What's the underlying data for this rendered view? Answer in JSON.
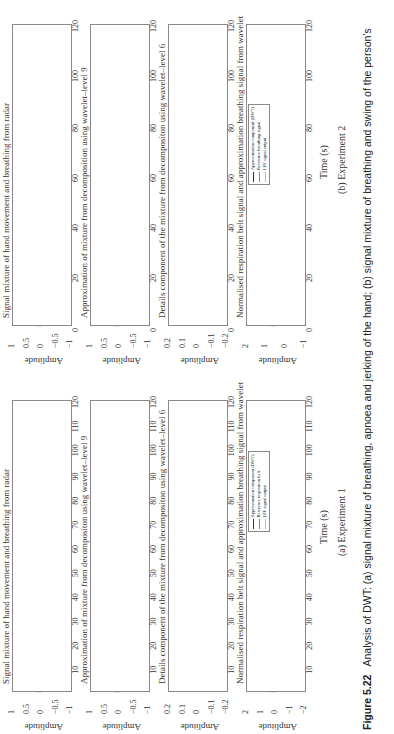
{
  "figure": {
    "number": "Figure 5.22",
    "caption": "Analysis of DWT: (a) signal mixture of breathing, apnoea and jerking of the hand; (b) signal mixture of breathing and swing of the person's",
    "caption_line2": "right hand, and the result of denoising"
  },
  "experiment_a": {
    "sublabel": "(a) Experiment 1",
    "xlabel": "Time (s)",
    "xticks": [
      "10",
      "20",
      "30",
      "40",
      "50",
      "60",
      "70",
      "80",
      "90",
      "100",
      "110",
      "120"
    ],
    "panels": [
      {
        "title": "Signal mixture of hand movement and breathing from radar",
        "ylabel": "Amplitude",
        "yticks": [
          "1",
          "0.5",
          "0",
          "−0.5",
          "−1"
        ]
      },
      {
        "title": "Approximation of mixture from decompositon using wavelet–level 9",
        "ylabel": "Amplitude",
        "yticks": [
          "1",
          "0.5",
          "0",
          "−0.5",
          "−1"
        ]
      },
      {
        "title": "Details component of the mixture from decompositon using wavelet–level 6",
        "ylabel": "Amplitude",
        "yticks": [
          "0.2",
          "0.1",
          "0",
          "−0.1",
          "−0.2"
        ]
      },
      {
        "title": "Normalised respiration belt signal and approximation breathing signal from wavelet",
        "ylabel": "Amplitude",
        "yticks": [
          "2",
          "1",
          "0",
          "−1",
          "−2"
        ],
        "legend": [
          "Approximation component (DWT)",
          "Reference respiration belt",
          "LPF signal output"
        ]
      }
    ]
  },
  "experiment_b": {
    "sublabel": "(b) Experiment 2",
    "xlabel": "Time (s)",
    "xticks": [
      "0",
      "20",
      "40",
      "60",
      "80",
      "100",
      "120"
    ],
    "panels": [
      {
        "title": "Signal mixture of hand movement and breathing from radar",
        "ylabel": "Amplitude",
        "yticks": [
          "1",
          "0.5",
          "0",
          "−0.5",
          "−1"
        ]
      },
      {
        "title": "Approximation of mixture from decomposition using wavelet–level 9",
        "ylabel": "Amplitude",
        "yticks": [
          "1",
          "0.5",
          "0",
          "−0.5",
          "−1"
        ]
      },
      {
        "title": "Details component of the mixture from decompositon using wavelet–level 6",
        "ylabel": "Amplitude",
        "yticks": [
          "0.2",
          "0.1",
          "0",
          "−0.1",
          "−0.2"
        ]
      },
      {
        "title": "Normalised respiration belt signal and approximation breathing signal from wavelet",
        "ylabel": "Amplitude",
        "yticks": [
          "2",
          "1",
          "0",
          "−1"
        ],
        "legend": [
          "Approximation component (DWT)",
          "Reference breathing signal",
          "LPF signal output"
        ]
      }
    ]
  },
  "chart_data": [
    {
      "type": "line",
      "title": "Signal mixture of hand movement and breathing from radar",
      "subfigure": "(a) Experiment 1",
      "xlabel": "Time (s)",
      "ylabel": "Amplitude",
      "xlim": [
        0,
        120
      ],
      "ylim": [
        -1,
        1
      ],
      "notes": "Breathing oscillation ~0.3 Hz with noisy hand-jerk bursts 15–60 s; apnoea flat segment ~68–82 s",
      "series": [
        {
          "name": "radar mixture",
          "x": [
            0,
            10,
            20,
            30,
            40,
            50,
            60,
            66,
            70,
            80,
            83,
            90,
            100,
            110,
            120
          ],
          "values": [
            0.3,
            0.5,
            0.6,
            -0.7,
            0.7,
            0.6,
            0.3,
            -0.6,
            -0.2,
            -0.1,
            0.5,
            0.5,
            0.5,
            0.5,
            0.5
          ]
        }
      ]
    },
    {
      "type": "line",
      "title": "Approximation of mixture from decompositon using wavelet–level 9",
      "subfigure": "(a) Experiment 1",
      "xlabel": "Time (s)",
      "ylabel": "Amplitude",
      "xlim": [
        0,
        120
      ],
      "ylim": [
        -1,
        1
      ],
      "series": [
        {
          "name": "approximation",
          "x": [
            0,
            10,
            20,
            30,
            40,
            50,
            60,
            66,
            70,
            80,
            83,
            90,
            100,
            110,
            120
          ],
          "values": [
            0.4,
            0.5,
            0.4,
            -0.6,
            0.5,
            0.5,
            0.4,
            -0.6,
            -0.2,
            -0.1,
            0.5,
            0.5,
            0.5,
            0.5,
            0.5
          ]
        }
      ]
    },
    {
      "type": "line",
      "title": "Details component of the mixture from decompositon using wavelet–level 6",
      "subfigure": "(a) Experiment 1",
      "xlabel": "Time (s)",
      "ylabel": "Amplitude",
      "xlim": [
        0,
        120
      ],
      "ylim": [
        -0.2,
        0.2
      ],
      "notes": "Bursts between ~16 s and ~61 s, peak spike ~0.15 near 47 s; near zero elsewhere",
      "series": [
        {
          "name": "details",
          "x": [
            0,
            16,
            20,
            25,
            35,
            45,
            47,
            55,
            61,
            120
          ],
          "values": [
            0,
            0.03,
            0.05,
            0.04,
            0.04,
            0.06,
            0.15,
            0.07,
            0.03,
            0
          ]
        }
      ]
    },
    {
      "type": "line",
      "title": "Normalised respiration belt signal and approximation breathing signal from wavelet",
      "subfigure": "(a) Experiment 1",
      "xlabel": "Time (s)",
      "ylabel": "Amplitude",
      "xlim": [
        0,
        120
      ],
      "ylim": [
        -2,
        2
      ],
      "legend": [
        "Approximation component (DWT)",
        "Reference respiration belt",
        "LPF signal output"
      ],
      "series": [
        {
          "name": "Approximation component (DWT)",
          "x": [
            0,
            20,
            40,
            60,
            66,
            70,
            80,
            90,
            100,
            110,
            120
          ],
          "values": [
            1,
            1,
            1,
            1,
            -1.5,
            -0.8,
            -0.6,
            1,
            1,
            1,
            1
          ]
        },
        {
          "name": "Reference respiration belt",
          "x": [
            0,
            20,
            40,
            60,
            66,
            70,
            80,
            90,
            100,
            110,
            120
          ],
          "values": [
            1,
            1,
            1,
            1,
            -1.4,
            -1.0,
            -0.7,
            1,
            1,
            1,
            1
          ]
        },
        {
          "name": "LPF signal output",
          "x": [
            0,
            20,
            40,
            60,
            66,
            70,
            80,
            90,
            100,
            110,
            120
          ],
          "values": [
            1,
            1,
            1,
            1,
            -1.4,
            -0.9,
            -0.7,
            1,
            1,
            1,
            1
          ]
        }
      ]
    },
    {
      "type": "line",
      "title": "Signal mixture of hand movement and breathing from radar",
      "subfigure": "(b) Experiment 2",
      "xlabel": "Time (s)",
      "ylabel": "Amplitude",
      "xlim": [
        0,
        120
      ],
      "ylim": [
        -1,
        1
      ],
      "notes": "Clean breathing 0–35 s, noisy bursts ~35–57 s and ~65–105 s",
      "series": [
        {
          "name": "radar mixture",
          "x": [
            0,
            20,
            35,
            45,
            57,
            65,
            80,
            100,
            105,
            120
          ],
          "values": [
            0.5,
            0.5,
            0.6,
            0.8,
            0.6,
            0.4,
            0.3,
            0.4,
            0.5,
            0.5
          ]
        }
      ]
    },
    {
      "type": "line",
      "title": "Approximation of mixture from decomposition using wavelet–level 9",
      "subfigure": "(b) Experiment 2",
      "xlabel": "Time (s)",
      "ylabel": "Amplitude",
      "xlim": [
        0,
        120
      ],
      "ylim": [
        -1,
        1
      ],
      "series": [
        {
          "name": "approximation",
          "x": [
            0,
            20,
            40,
            60,
            80,
            100,
            120
          ],
          "values": [
            0.5,
            0.5,
            0.5,
            0.5,
            0.4,
            0.5,
            0.6
          ]
        }
      ]
    },
    {
      "type": "line",
      "title": "Details component of the mixture from decompositon using wavelet–level 6",
      "subfigure": "(b) Experiment 2",
      "xlabel": "Time (s)",
      "ylabel": "Amplitude",
      "xlim": [
        0,
        120
      ],
      "ylim": [
        -0.2,
        0.2
      ],
      "notes": "Bursts ~35–57 s (peak ~0.12) and ~65–104 s (peak ~0.08)",
      "series": [
        {
          "name": "details",
          "x": [
            0,
            35,
            45,
            57,
            65,
            80,
            104,
            120
          ],
          "values": [
            0,
            0.05,
            0.12,
            0.08,
            0.04,
            0.08,
            0.04,
            0
          ]
        }
      ]
    },
    {
      "type": "line",
      "title": "Normalised respiration belt signal and approximation breathing signal from wavelet",
      "subfigure": "(b) Experiment 2",
      "xlabel": "Time (s)",
      "ylabel": "Amplitude",
      "xlim": [
        0,
        120
      ],
      "ylim": [
        -1,
        2.5
      ],
      "legend": [
        "Approximation component (DWT)",
        "Reference breathing signal",
        "LPF signal output"
      ],
      "series": [
        {
          "name": "Approximation component (DWT)",
          "x": [
            0,
            20,
            40,
            60,
            80,
            100,
            120
          ],
          "values": [
            1,
            1,
            1,
            1,
            1,
            1,
            1
          ]
        },
        {
          "name": "Reference breathing signal",
          "x": [
            0,
            20,
            40,
            60,
            80,
            100,
            120
          ],
          "values": [
            1,
            1,
            1,
            1,
            1.2,
            1.2,
            1
          ]
        },
        {
          "name": "LPF signal output",
          "x": [
            0,
            20,
            40,
            60,
            80,
            100,
            120
          ],
          "values": [
            1,
            1,
            1,
            1,
            1,
            1,
            1
          ]
        }
      ]
    }
  ]
}
